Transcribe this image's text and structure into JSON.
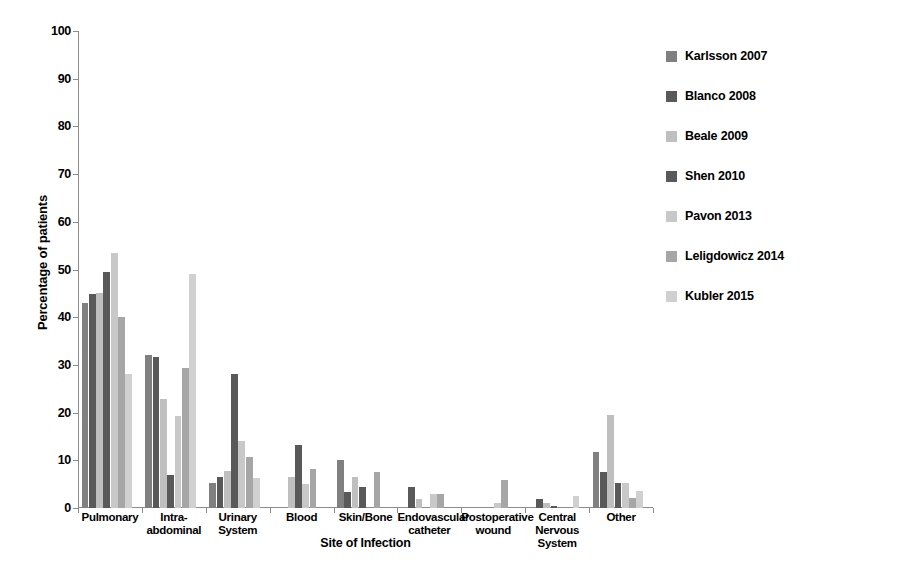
{
  "chart_data": {
    "type": "bar",
    "title": "",
    "xlabel": "Site of Infection",
    "ylabel": "Percentage of patients",
    "ylim": [
      0,
      100
    ],
    "ytick_step": 10,
    "yticks": [
      "0",
      "10",
      "20",
      "30",
      "40",
      "50",
      "60",
      "70",
      "80",
      "90",
      "100"
    ],
    "grid": false,
    "legend_position": "right",
    "categories": [
      "Pulmonary",
      "Intra-abdominal",
      "Urinary System",
      "Blood",
      "Skin/Bone",
      "Endovascular catheter",
      "Postoperative wound",
      "Central Nervous System",
      "Other"
    ],
    "series": [
      {
        "name": "Karlsson 2007",
        "color": "#808080",
        "values": [
          43.0,
          32.0,
          5.2,
          null,
          10.0,
          null,
          null,
          null,
          11.8
        ]
      },
      {
        "name": "Blanco 2008",
        "color": "#595959",
        "values": [
          44.8,
          31.6,
          6.4,
          null,
          3.3,
          4.4,
          null,
          1.8,
          7.5
        ]
      },
      {
        "name": "Beale 2009",
        "color": "#bfbfbf",
        "values": [
          45.0,
          22.8,
          7.8,
          6.5,
          6.5,
          1.9,
          null,
          1.0,
          19.5
        ]
      },
      {
        "name": "Shen 2010",
        "color": "#595959",
        "values": [
          49.5,
          7.0,
          28.0,
          13.2,
          4.5,
          null,
          null,
          0.5,
          5.2
        ]
      },
      {
        "name": "Pavon 2013",
        "color": "#c8c8c8",
        "values": [
          53.5,
          19.3,
          14.0,
          5.0,
          null,
          3.0,
          1.0,
          null,
          5.2
        ]
      },
      {
        "name": "Leligdowicz 2014",
        "color": "#a6a6a6",
        "values": [
          40.0,
          29.3,
          10.6,
          8.1,
          7.6,
          2.9,
          5.9,
          null,
          2.0
        ]
      },
      {
        "name": "Kubler 2015",
        "color": "#d0d0d0",
        "values": [
          28.0,
          49.0,
          6.2,
          null,
          null,
          null,
          null,
          2.5,
          3.5
        ]
      }
    ]
  },
  "caption": {
    "text": ""
  }
}
